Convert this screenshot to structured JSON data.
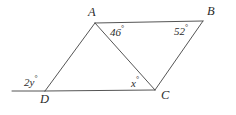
{
  "figure": {
    "kind": "geometry-diagram",
    "background_color": "#ffffff",
    "stroke_color": "#555555",
    "text_color": "#2b2b2b"
  },
  "vertices": [
    {
      "id": "A",
      "label": "A",
      "x": 95,
      "y": 23
    },
    {
      "id": "B",
      "label": "B",
      "x": 203,
      "y": 21
    },
    {
      "id": "C",
      "label": "C",
      "x": 155,
      "y": 90
    },
    {
      "id": "D",
      "label": "D",
      "x": 45,
      "y": 91
    }
  ],
  "segments": [
    {
      "name": "side-AB",
      "from": "A",
      "to": "B"
    },
    {
      "name": "side-BC",
      "from": "B",
      "to": "C"
    },
    {
      "name": "side-DC",
      "from": "D",
      "to": "C"
    },
    {
      "name": "side-DA",
      "from": "D",
      "to": "A"
    },
    {
      "name": "diagonal-AC",
      "from": "A",
      "to": "C"
    },
    {
      "name": "extension-left-of-D",
      "from": "D",
      "to": "exterior",
      "x1": 45,
      "y1": 91,
      "x2": 12,
      "y2": 91
    }
  ],
  "angles": {
    "at_A": {
      "name": "angle-BAC",
      "value": "46",
      "degree": "°",
      "text": "46°"
    },
    "at_B": {
      "name": "angle-ABC",
      "value": "52",
      "degree": "°",
      "text": "52°"
    },
    "at_C": {
      "name": "angle-ACD",
      "value": "x",
      "degree": "°",
      "text": "x°"
    },
    "at_D": {
      "name": "exterior-angle-at-D",
      "value": "2y",
      "degree": "°",
      "text": "2y°"
    }
  }
}
